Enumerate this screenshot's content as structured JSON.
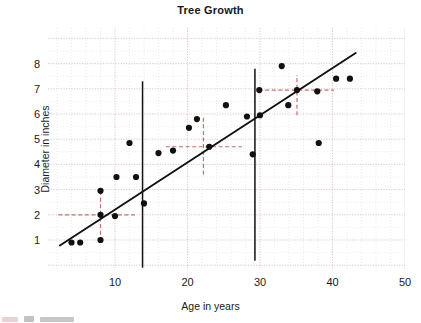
{
  "chart_data": {
    "type": "scatter",
    "title": "Tree Growth",
    "xlabel": "Age in years",
    "ylabel": "Diameter in inches",
    "xlim": [
      0,
      50
    ],
    "ylim": [
      0,
      8.8
    ],
    "xticks": [
      10,
      20,
      30,
      40,
      50
    ],
    "yticks": [
      1,
      2,
      3,
      4,
      5,
      6,
      7,
      8
    ],
    "grid": true,
    "grid_color": "#d9b3b3",
    "legend": "none",
    "point_color": "#111111",
    "trendline_color": "#111111",
    "marker_line_color": "#111111",
    "crosshair_color": "#c4706e",
    "points": [
      {
        "x": 4.0,
        "y": 0.9
      },
      {
        "x": 5.2,
        "y": 0.9
      },
      {
        "x": 8.0,
        "y": 1.0
      },
      {
        "x": 8.0,
        "y": 2.0
      },
      {
        "x": 8.0,
        "y": 2.95
      },
      {
        "x": 10.0,
        "y": 1.95
      },
      {
        "x": 10.2,
        "y": 3.5
      },
      {
        "x": 12.0,
        "y": 4.85
      },
      {
        "x": 12.9,
        "y": 3.5
      },
      {
        "x": 14.0,
        "y": 2.45
      },
      {
        "x": 16.0,
        "y": 4.45
      },
      {
        "x": 18.0,
        "y": 4.55
      },
      {
        "x": 20.2,
        "y": 5.45
      },
      {
        "x": 21.3,
        "y": 5.8
      },
      {
        "x": 23.0,
        "y": 4.7
      },
      {
        "x": 25.3,
        "y": 6.35
      },
      {
        "x": 28.2,
        "y": 5.9
      },
      {
        "x": 29.0,
        "y": 4.4
      },
      {
        "x": 30.0,
        "y": 5.95
      },
      {
        "x": 29.9,
        "y": 6.95
      },
      {
        "x": 33.0,
        "y": 7.9
      },
      {
        "x": 33.9,
        "y": 6.35
      },
      {
        "x": 35.1,
        "y": 6.95
      },
      {
        "x": 37.9,
        "y": 6.9
      },
      {
        "x": 38.1,
        "y": 4.85
      },
      {
        "x": 40.5,
        "y": 7.4
      },
      {
        "x": 42.4,
        "y": 7.4
      }
    ],
    "trendline": {
      "x0": 2.4,
      "y0": 0.78,
      "x1": 43.2,
      "y1": 8.42
    },
    "vertical_markers": [
      {
        "x": 13.8,
        "y_top": 7.3,
        "y_bottom": -0.1
      },
      {
        "x": 29.3,
        "y_top": 7.8,
        "y_bottom": 0.18
      }
    ],
    "crosshairs": [
      {
        "x": 8.0,
        "y": 2.0,
        "h_x0": 2.2,
        "h_x1": 13.1,
        "v_y0": 0.95,
        "v_y1": 3.05
      },
      {
        "x": 22.2,
        "y": 4.7,
        "h_x0": 17.0,
        "h_x1": 27.5,
        "v_y0": 3.6,
        "v_y1": 5.85
      },
      {
        "x": 35.1,
        "y": 6.95,
        "h_x0": 29.8,
        "h_x1": 40.2,
        "v_y0": 5.95,
        "v_y1": 7.55
      }
    ]
  }
}
